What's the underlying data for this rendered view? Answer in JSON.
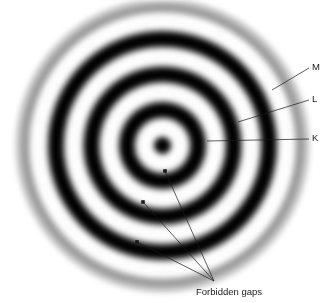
{
  "figure": {
    "background_color": "#ffffff",
    "ink_color": "#1a1a1a",
    "width": 333,
    "height": 303
  },
  "pattern": {
    "type": "concentric-rings",
    "center": {
      "x": 162,
      "y": 145
    },
    "outer_radius": 150,
    "dark_ring_radii": [
      0,
      40,
      73,
      107,
      142
    ],
    "bright_ring_radii": [
      22,
      56,
      90,
      124
    ],
    "ring_softness": "gaussian-blurred",
    "grain": "film-noise"
  },
  "shell_labels": [
    {
      "id": "M",
      "label": "M",
      "text_x": 312,
      "text_y": 62,
      "leader_from_x": 309,
      "leader_from_y": 68,
      "leader_to_x": 272,
      "leader_to_y": 90
    },
    {
      "id": "L",
      "label": "L",
      "text_x": 312,
      "text_y": 94,
      "leader_from_x": 309,
      "leader_from_y": 100,
      "leader_to_x": 238,
      "leader_to_y": 122
    },
    {
      "id": "K",
      "label": "K",
      "text_x": 312,
      "text_y": 133,
      "leader_from_x": 309,
      "leader_from_y": 139,
      "leader_to_x": 207,
      "leader_to_y": 141
    }
  ],
  "annotation": {
    "caption": "Forbidden gaps",
    "caption_x": 196,
    "caption_y": 286,
    "converge_x": 214,
    "converge_y": 281,
    "markers": [
      {
        "x": 165,
        "y": 171
      },
      {
        "x": 143,
        "y": 202
      },
      {
        "x": 137,
        "y": 242
      }
    ]
  }
}
